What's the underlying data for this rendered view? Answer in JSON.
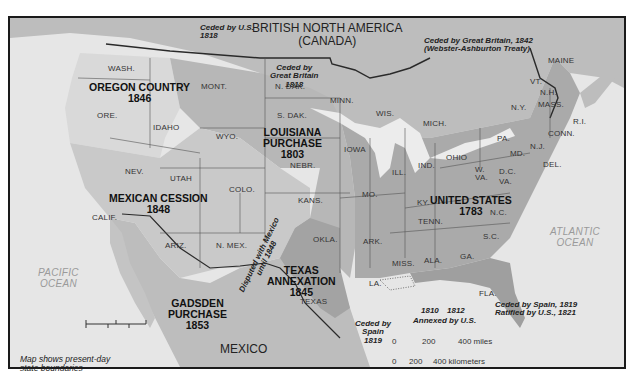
{
  "map": {
    "colors": {
      "ocean": "#e6e6e6",
      "foreign_land": "#b9b9b9",
      "us_1783": "#a9a9a9",
      "louisiana": "#b5b5b5",
      "oregon": "#d8d8d8",
      "mexican_cession": "#c8c8c8",
      "texas": "#a0a0a0",
      "florida": "#9d9d9d",
      "lakes": "#ececec",
      "border": "#333333"
    },
    "countries": {
      "canada": "BRITISH NORTH AMERICA\n(CANADA)",
      "mexico": "MEXICO"
    },
    "oceans": {
      "pacific": "PACIFIC\nOCEAN",
      "atlantic": "ATLANTIC\nOCEAN"
    },
    "regions": {
      "oregon": {
        "name": "OREGON COUNTRY",
        "year": "1846"
      },
      "louisiana": {
        "name": "LOUISIANA\nPURCHASE",
        "year": "1803"
      },
      "mexican_cession": {
        "name": "MEXICAN CESSION",
        "year": "1848"
      },
      "texas": {
        "name": "TEXAS\nANNEXATION",
        "year": "1845"
      },
      "gadsden": {
        "name": "GADSDEN\nPURCHASE",
        "year": "1853"
      },
      "united_states": {
        "name": "UNITED STATES",
        "year": "1783"
      }
    },
    "notes": {
      "ceded_us_1818": "Ceded by U.S.\n1818",
      "ceded_gb_1818": "Ceded by\nGreat Britain\n1818",
      "ceded_gb_1842": "Ceded by Great Britain, 1842\n(Webster-Ashburton Treaty)",
      "disputed_mexico": "Disputed with Mexico\nuntil 1848",
      "ceded_spain_1819": "Ceded by\nSpain\n1819",
      "annexed_1810": "1810",
      "annexed_1812": "1812",
      "annexed_by_us": "Annexed by U.S.",
      "florida_cession": "Ceded by Spain, 1819\nRatified by U.S., 1821"
    },
    "states": {
      "wash": "WASH.",
      "ore": "ORE.",
      "idaho": "IDAHO",
      "mont": "MONT.",
      "wyo": "WYO.",
      "nev": "NEV.",
      "utah": "UTAH",
      "calif": "CALIF.",
      "colo": "COLO.",
      "ariz": "ARIZ.",
      "nmex": "N. MEX.",
      "ndak": "N. DAK.",
      "sdak": "S. DAK.",
      "nebr": "NEBR.",
      "kans": "KANS.",
      "okla": "OKLA.",
      "texas": "TEXAS",
      "minn": "MINN.",
      "iowa": "IOWA",
      "mo": "MO.",
      "ark": "ARK.",
      "la": "LA.",
      "wis": "WIS.",
      "ill": "ILL.",
      "mich": "MICH.",
      "ind": "IND.",
      "ohio": "OHIO",
      "ky": "KY.",
      "tenn": "TENN.",
      "miss": "MISS.",
      "ala": "ALA.",
      "ga": "GA.",
      "fla": "FLA.",
      "sc": "S.C.",
      "nc": "N.C.",
      "va": "VA.",
      "wva": "W.\nVA.",
      "dc": "D.C.",
      "md": "MD.",
      "del": "DEL.",
      "nj": "N.J.",
      "pa": "PA.",
      "ny": "N.Y.",
      "conn": "CONN.",
      "ri": "R.I.",
      "mass": "MASS.",
      "vt": "VT.",
      "nh": "N.H.",
      "maine": "MAINE"
    },
    "scale": {
      "miles_ticks": [
        "0",
        "200",
        "400 miles"
      ],
      "km_ticks": [
        "0",
        "200",
        "400 kilometers"
      ]
    },
    "caption": "Map shows present-day\nstate boundaries"
  }
}
